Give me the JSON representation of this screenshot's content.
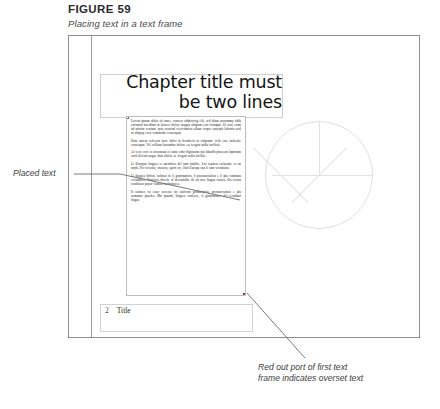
{
  "figure": {
    "label": "FIGURE 59",
    "caption": "Placing text in a text frame"
  },
  "document_page": {
    "chapter_title": {
      "line1": "Chapter title must",
      "line2": "be two lines"
    },
    "footer": {
      "page_number": "2",
      "running_head": "Title"
    },
    "body_paragraphs": [
      "Lorem ipsum dolor sit amet, consect adipiscing elit, sed diam nonummy nibh euismod tincidunt ut laoreet dolore magna aliquam erat volutpat. Ut wisi enim ad minim veniam, quis nostrud exercitation ullam corper suscipit lobortis nisl ut aliquip exea commodo consequat.",
      "Duis autem velerem irure dolor in hendrerit in vulputate velit esse molestie consequat. Vel willum lunombro dolore eu feugiat nulla facilisis.",
      "At vero eros et accumsan et iusto odio dignissim qui blandit praesent luptatum zzril delenit augue duis dolore te feugait nulla facilisi.",
      "Li Europan lingues es membres del sam familie. Lor separat existentie es un myth. Por scientie, musica, sport etc, litot Europa usa li sam vocabular.",
      "Li lingues differe solmen in li grammatica, li pronunciation e li plu commun vocabules. Omnicos directe al desirabilite de un nov lingua franca. On refusa continuar payar custosi traductores.",
      "It solmen va esser necessi far uniform grammatica, pronunciation e plu sommun paroles. Ma quande lingues coalesce, li grammatica del resultant lingue"
    ]
  },
  "annotations": {
    "left": "Placed text",
    "right": "Red out port of first text\nframe indicates overset text"
  },
  "colors": {
    "overset_port": "#d9534f",
    "page_border": "#8e8e8e",
    "leader_line": "#7a7a7a"
  }
}
